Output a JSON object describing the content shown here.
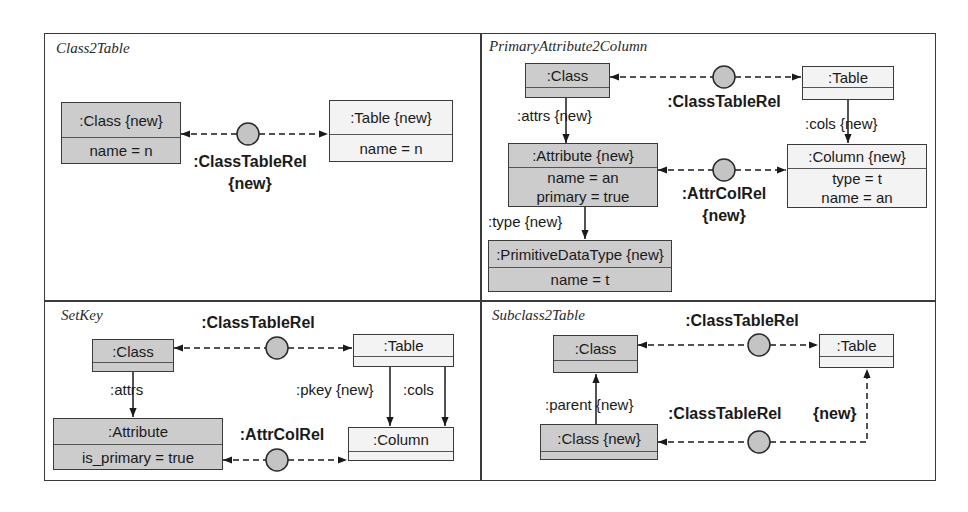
{
  "colors": {
    "line": "#3a3a3a",
    "existing_node_fill": "#cccccc",
    "target_node_fill": "#f3f3f3",
    "relation_circle_fill": "#c4c4c4"
  },
  "panels": [
    {
      "title": "Class2Table",
      "nodes": [
        {
          "id": "class",
          "header": ":Class {new}",
          "attrs": [
            "name = n"
          ],
          "fill": "gray"
        },
        {
          "id": "table",
          "header": ":Table {new}",
          "attrs": [
            "name = n"
          ],
          "fill": "white"
        }
      ],
      "relations": [
        {
          "label": ":ClassTableRel",
          "modifier": "{new}",
          "from": "class",
          "to": "table"
        }
      ],
      "edges": []
    },
    {
      "title": "PrimaryAttribute2Column",
      "nodes": [
        {
          "id": "class",
          "header": ":Class",
          "attrs": [],
          "fill": "gray"
        },
        {
          "id": "table",
          "header": ":Table",
          "attrs": [],
          "fill": "white"
        },
        {
          "id": "attribute",
          "header": ":Attribute {new}",
          "attrs": [
            "name = an",
            "primary = true"
          ],
          "fill": "gray"
        },
        {
          "id": "column",
          "header": ":Column {new}",
          "attrs": [
            "type = t",
            "name = an"
          ],
          "fill": "white"
        },
        {
          "id": "primitive",
          "header": ":PrimitiveDataType {new}",
          "attrs": [
            "name = t"
          ],
          "fill": "gray"
        }
      ],
      "relations": [
        {
          "label": ":ClassTableRel",
          "modifier": "",
          "from": "class",
          "to": "table"
        },
        {
          "label": ":AttrColRel",
          "modifier": "{new}",
          "from": "attribute",
          "to": "column"
        }
      ],
      "edges": [
        {
          "label": ":attrs {new}",
          "from": "class",
          "to": "attribute"
        },
        {
          "label": ":cols {new}",
          "from": "table",
          "to": "column"
        },
        {
          "label": ":type {new}",
          "from": "attribute",
          "to": "primitive"
        }
      ]
    },
    {
      "title": "SetKey",
      "nodes": [
        {
          "id": "class",
          "header": ":Class",
          "attrs": [],
          "fill": "gray"
        },
        {
          "id": "table",
          "header": ":Table",
          "attrs": [],
          "fill": "white"
        },
        {
          "id": "attribute",
          "header": ":Attribute",
          "attrs": [
            "is_primary = true"
          ],
          "fill": "gray"
        },
        {
          "id": "column",
          "header": ":Column",
          "attrs": [],
          "fill": "white"
        }
      ],
      "relations": [
        {
          "label": ":ClassTableRel",
          "modifier": "",
          "from": "class",
          "to": "table"
        },
        {
          "label": ":AttrColRel",
          "modifier": "",
          "from": "attribute",
          "to": "column"
        }
      ],
      "edges": [
        {
          "label": ":attrs",
          "from": "class",
          "to": "attribute"
        },
        {
          "label": ":pkey {new}",
          "from": "table",
          "to": "column"
        },
        {
          "label": ":cols",
          "from": "table",
          "to": "column"
        }
      ]
    },
    {
      "title": "Subclass2Table",
      "nodes": [
        {
          "id": "class",
          "header": ":Class",
          "attrs": [],
          "fill": "gray"
        },
        {
          "id": "table",
          "header": ":Table",
          "attrs": [],
          "fill": "white"
        },
        {
          "id": "subclass",
          "header": ":Class {new}",
          "attrs": [],
          "fill": "gray"
        }
      ],
      "relations": [
        {
          "label": ":ClassTableRel",
          "modifier": "",
          "from": "class",
          "to": "table"
        },
        {
          "label": ":ClassTableRel",
          "modifier": "{new}",
          "from": "subclass",
          "to": "table"
        }
      ],
      "edges": [
        {
          "label": ":parent {new}",
          "from": "subclass",
          "to": "class"
        }
      ]
    }
  ]
}
